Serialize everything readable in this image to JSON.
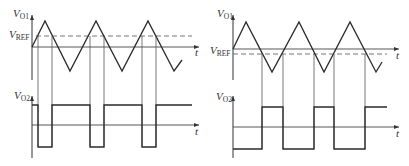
{
  "panels": [
    {
      "id": "left",
      "top_axis_label": "V",
      "top_axis_sub": "O1",
      "ref_label": "V",
      "ref_sub": "REF",
      "time_label_top": "t",
      "bottom_axis_label": "V",
      "bottom_axis_sub": "O2",
      "time_label_bottom": "t",
      "ref_position": "above zero (positive V_REF)"
    },
    {
      "id": "right",
      "top_axis_label": "V",
      "top_axis_sub": "O1",
      "ref_label": "V",
      "ref_sub": "REF",
      "time_label_top": "t",
      "bottom_axis_label": "V",
      "bottom_axis_sub": "O2",
      "time_label_bottom": "t",
      "ref_position": "below zero (negative V_REF)"
    }
  ],
  "colors": {
    "line": "#2a2a2a",
    "axis": "#3a3a3a",
    "guide": "#555555",
    "dashed": "#666666"
  }
}
